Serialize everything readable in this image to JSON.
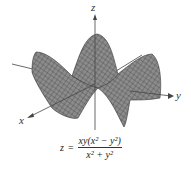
{
  "figure": {
    "axes": {
      "x_label": "x",
      "y_label": "y",
      "z_label": "z"
    },
    "formula": {
      "lhs": "z",
      "eq": "=",
      "numerator_html": "xy(x² − y²)",
      "denominator_html": "x² + y²"
    },
    "colors": {
      "surface": "#8a8a8a",
      "mesh": "#3a3a3a",
      "axis": "#444444"
    }
  }
}
